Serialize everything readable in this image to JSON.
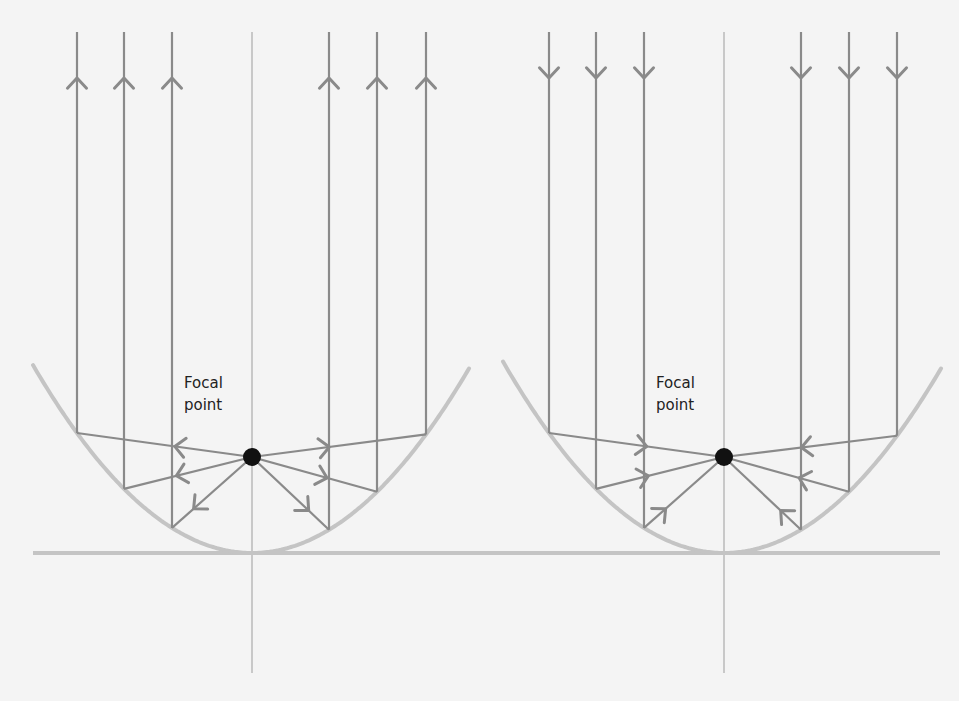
{
  "colors": {
    "background": "#f4f4f4",
    "ray": "#8a8a8a",
    "mirror": "#c4c4c4",
    "axis": "#bdbdbd",
    "focal_point": "#111111",
    "label": "#222222"
  },
  "diagrams": [
    {
      "name": "transmitting",
      "description": "Rays from focal point reflect off parabola and travel outward parallel",
      "axis_x": 252,
      "focus": {
        "x": 252,
        "y": 457
      },
      "label": {
        "line1": "Focal",
        "line2": "point",
        "x": 184,
        "y": 374
      },
      "ray_direction": "outward",
      "ray_xs": [
        77,
        124,
        172,
        329,
        377,
        426
      ],
      "parabola_x_range": [
        33,
        470
      ]
    },
    {
      "name": "receiving",
      "description": "Parallel incoming rays reflect off parabola and converge at focal point",
      "axis_x": 724,
      "focus": {
        "x": 724,
        "y": 457
      },
      "label": {
        "line1": "Focal",
        "line2": "point",
        "x": 656,
        "y": 374
      },
      "ray_direction": "inward",
      "ray_xs": [
        549,
        596,
        644,
        801,
        849,
        897
      ],
      "parabola_x_range": [
        503,
        942
      ]
    }
  ],
  "geometry": {
    "vertex_y": 553,
    "curvature_k": 0.003918,
    "ray_top_y": 32,
    "axis_bottom_y": 673,
    "baseline": {
      "x1": 33,
      "x2": 940,
      "y": 553
    },
    "vertical_arrow_y": 78
  }
}
